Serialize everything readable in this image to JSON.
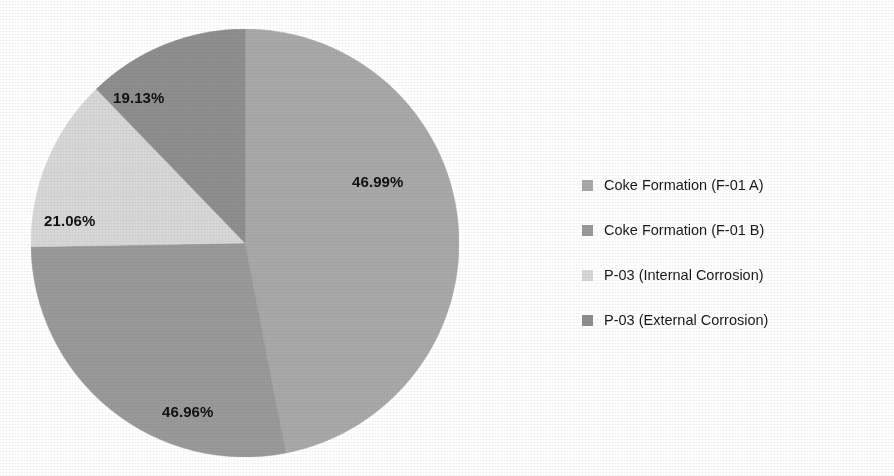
{
  "chart_data": {
    "type": "pie",
    "title": "",
    "subtitle": "",
    "xlabel": "",
    "ylabel": "",
    "legend_position": "right",
    "grid": false,
    "categories": [
      "Coke Formation (F-01 A)",
      "Coke Formation (F-01 B)",
      "P-03 (Internal Corrosion)",
      "P-03 (External Corrosion)"
    ],
    "values": [
      46.99,
      46.96,
      21.06,
      19.13
    ],
    "value_labels": [
      "46.99%",
      "46.96%",
      "21.06%",
      "19.13%"
    ],
    "colors": [
      "#a9a9a9",
      "#9a9a9a",
      "#d8d8d8",
      "#8f8f8f"
    ],
    "slice_sweeps_deg": [
      169.0,
      100.0,
      47.0,
      44.0
    ],
    "start_angle_deg": 0,
    "direction": "clockwise"
  },
  "pie": {
    "slices": [
      {
        "key": "coke-formation-f01a",
        "label": "Coke Formation (F-01 A)",
        "value_label": "46.99%",
        "color": "#a9a9a9",
        "sweep": 169.0,
        "label_x": 352,
        "label_y": 173
      },
      {
        "key": "coke-formation-f01b",
        "label": "Coke Formation (F-01 B)",
        "value_label": "46.96%",
        "color": "#9a9a9a",
        "sweep": 100.0,
        "label_x": 162,
        "label_y": 403
      },
      {
        "key": "p03-internal-corrosion",
        "label": "P-03 (Internal Corrosion)",
        "value_label": "21.06%",
        "color": "#d8d8d8",
        "sweep": 47.0,
        "label_x": 44,
        "label_y": 212
      },
      {
        "key": "p03-external-corrosion",
        "label": "P-03 (External Corrosion)",
        "value_label": "19.13%",
        "color": "#8f8f8f",
        "sweep": 44.0,
        "label_x": 113,
        "label_y": 89
      }
    ]
  },
  "legend": {
    "items": [
      {
        "label": "Coke Formation (F-01 A)",
        "color": "#a9a9a9"
      },
      {
        "label": "Coke Formation (F-01 B)",
        "color": "#9a9a9a"
      },
      {
        "label": "P-03 (Internal Corrosion)",
        "color": "#d8d8d8"
      },
      {
        "label": "P-03 (External Corrosion)",
        "color": "#8f8f8f"
      }
    ]
  }
}
